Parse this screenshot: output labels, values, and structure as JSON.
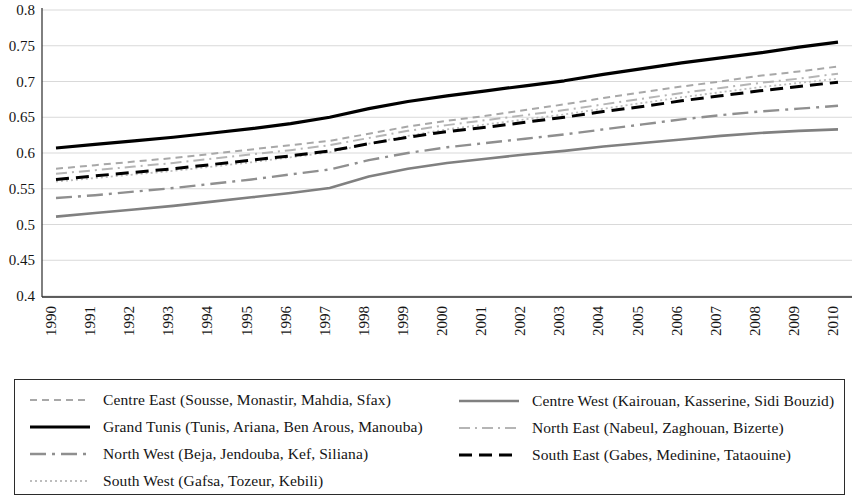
{
  "chart_data": {
    "type": "line",
    "title": "",
    "xlabel": "",
    "ylabel": "",
    "ylim": [
      0.4,
      0.8
    ],
    "ytick_labels": [
      "0.8",
      "0.75",
      "0.7",
      "0.65",
      "0.6",
      "0.55",
      "0.5",
      "0.45",
      "0.4"
    ],
    "ytick_values": [
      0.8,
      0.75,
      0.7,
      0.65,
      0.6,
      0.55,
      0.5,
      0.45,
      0.4
    ],
    "grid": true,
    "legend_position": "below",
    "categories": [
      "1990",
      "1991",
      "1992",
      "1993",
      "1994",
      "1995",
      "1996",
      "1997",
      "1998",
      "1999",
      "2000",
      "2001",
      "2002",
      "2003",
      "2004",
      "2005",
      "2006",
      "2007",
      "2008",
      "2009",
      "2010"
    ],
    "x": [
      1990,
      1991,
      1992,
      1993,
      1994,
      1995,
      1996,
      1997,
      1998,
      1999,
      2000,
      2001,
      2002,
      2003,
      2004,
      2005,
      2006,
      2007,
      2008,
      2009,
      2010
    ],
    "series": [
      {
        "name": "Centre East (Sousse, Monastir, Mahdia, Sfax)",
        "style": "dashed-light",
        "color": "#a8a8a8",
        "width": 2.0,
        "dash": "7,5",
        "values": [
          0.578,
          0.583,
          0.588,
          0.593,
          0.599,
          0.605,
          0.611,
          0.617,
          0.627,
          0.637,
          0.645,
          0.652,
          0.66,
          0.668,
          0.677,
          0.685,
          0.693,
          0.7,
          0.708,
          0.714,
          0.721
        ]
      },
      {
        "name": "Grand Tunis (Tunis, Ariana, Ben Arous, Manouba)",
        "style": "solid-bold",
        "color": "#000000",
        "width": 3.2,
        "dash": "none",
        "values": [
          0.607,
          0.612,
          0.617,
          0.622,
          0.628,
          0.634,
          0.641,
          0.65,
          0.662,
          0.672,
          0.68,
          0.687,
          0.694,
          0.701,
          0.71,
          0.718,
          0.726,
          0.733,
          0.74,
          0.748,
          0.755
        ]
      },
      {
        "name": "North West (Beja, Jendouba, Kef, Siliana)",
        "style": "dash-dot-gray",
        "color": "#8f8f8f",
        "width": 2.4,
        "dash": "16,6,3,6",
        "values": [
          0.537,
          0.541,
          0.546,
          0.551,
          0.557,
          0.563,
          0.57,
          0.577,
          0.59,
          0.6,
          0.608,
          0.614,
          0.62,
          0.626,
          0.633,
          0.64,
          0.647,
          0.653,
          0.658,
          0.662,
          0.666
        ]
      },
      {
        "name": "South West (Gafsa, Tozeur, Kebili)",
        "style": "dotted-light",
        "color": "#bdbdbd",
        "width": 1.8,
        "dash": "2,3",
        "values": [
          0.56,
          0.565,
          0.57,
          0.575,
          0.581,
          0.587,
          0.594,
          0.601,
          0.613,
          0.624,
          0.633,
          0.64,
          0.647,
          0.654,
          0.662,
          0.67,
          0.678,
          0.685,
          0.692,
          0.698,
          0.704
        ]
      },
      {
        "name": "Centre West (Kairouan, Kasserine, Sidi Bouzid)",
        "style": "solid-gray",
        "color": "#808080",
        "width": 2.6,
        "dash": "none",
        "values": [
          0.511,
          0.516,
          0.521,
          0.526,
          0.532,
          0.538,
          0.544,
          0.551,
          0.567,
          0.578,
          0.586,
          0.592,
          0.598,
          0.603,
          0.609,
          0.614,
          0.619,
          0.624,
          0.628,
          0.631,
          0.633
        ]
      },
      {
        "name": "North East (Nabeul, Zaghouan, Bizerte)",
        "style": "dash-dot-light",
        "color": "#b5b5b5",
        "width": 2.0,
        "dash": "11,5,2,5",
        "values": [
          0.571,
          0.576,
          0.581,
          0.586,
          0.592,
          0.598,
          0.604,
          0.611,
          0.621,
          0.631,
          0.639,
          0.646,
          0.653,
          0.66,
          0.668,
          0.676,
          0.684,
          0.691,
          0.698,
          0.704,
          0.711
        ]
      },
      {
        "name": "South East (Gabes, Medinine, Tataouine)",
        "style": "dashed-bold",
        "color": "#000000",
        "width": 3.0,
        "dash": "13,7",
        "values": [
          0.563,
          0.568,
          0.573,
          0.578,
          0.584,
          0.59,
          0.596,
          0.603,
          0.613,
          0.622,
          0.63,
          0.636,
          0.643,
          0.65,
          0.658,
          0.665,
          0.673,
          0.68,
          0.687,
          0.693,
          0.699
        ]
      }
    ]
  },
  "legend": {
    "left_column": [
      {
        "label": "Centre East (Sousse, Monastir, Mahdia, Sfax)",
        "series_index": 0
      },
      {
        "label": "Grand Tunis (Tunis, Ariana, Ben Arous, Manouba)",
        "series_index": 1
      },
      {
        "label": "North West (Beja, Jendouba, Kef, Siliana)",
        "series_index": 2
      },
      {
        "label": "South West (Gafsa, Tozeur, Kebili)",
        "series_index": 3
      }
    ],
    "right_column": [
      {
        "label": "Centre West (Kairouan, Kasserine, Sidi Bouzid)",
        "series_index": 4
      },
      {
        "label": "North East (Nabeul, Zaghouan, Bizerte)",
        "series_index": 5
      },
      {
        "label": "South East (Gabes, Medinine, Tataouine)",
        "series_index": 6
      }
    ]
  },
  "colors": {
    "axis": "#2b2b2b",
    "grid": "#d9d9d9",
    "text": "#151515",
    "legend_border": "#2b2b2b"
  }
}
